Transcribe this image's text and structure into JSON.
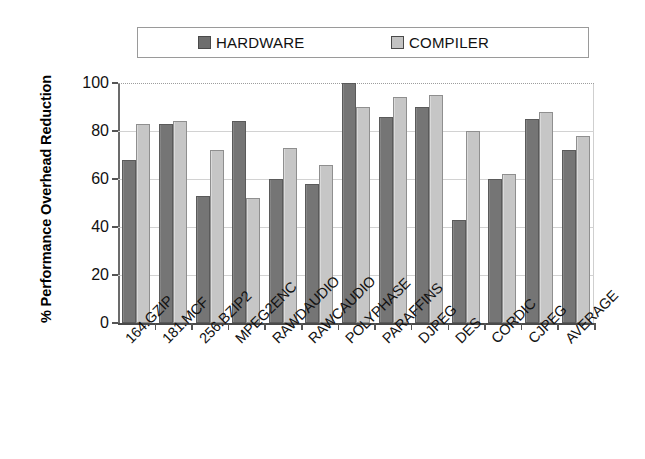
{
  "chart_data": {
    "type": "bar",
    "title": "",
    "xlabel": "",
    "ylabel": "% Performance Overhead Reduction",
    "ylim": [
      0,
      100
    ],
    "yticks": [
      0,
      20,
      40,
      60,
      80,
      100
    ],
    "ytick_labels": [
      "0",
      "20",
      "40",
      "60",
      "80",
      "100"
    ],
    "grid": true,
    "legend_position": "top",
    "categories": [
      "164.GZIP",
      "181.MCF",
      "256.BZIP2",
      "MPEG2ENC",
      "RAWDAUDIO",
      "RAWCAUDIO",
      "POLYPHASE",
      "PARAFFINS",
      "DJPEG",
      "DES",
      "CORDIC",
      "CJPEG",
      "AVERAGE"
    ],
    "series": [
      {
        "name": "HARDWARE",
        "color": "#757575",
        "values": [
          68,
          83,
          53,
          84,
          60,
          58,
          100,
          86,
          90,
          43,
          60,
          85,
          72
        ]
      },
      {
        "name": "COMPILER",
        "color": "#c6c6c6",
        "values": [
          83,
          84,
          72,
          52,
          73,
          66,
          90,
          94,
          95,
          80,
          62,
          88,
          78
        ]
      }
    ]
  },
  "legend": {
    "entries": [
      {
        "label": "HARDWARE",
        "swatch": "hardware-swatch"
      },
      {
        "label": "COMPILER",
        "swatch": "compiler-swatch"
      }
    ]
  },
  "axes": {
    "y_title": "% Performance Overhead Reduction"
  }
}
